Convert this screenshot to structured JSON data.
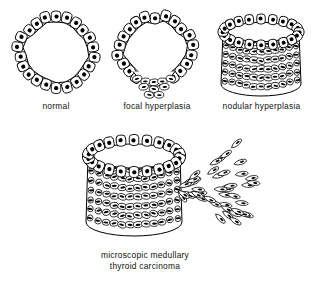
{
  "figure": {
    "background_color": "#ffffff",
    "ink_color": "#000000",
    "caption_color": "#111111"
  },
  "panels": [
    {
      "id": "normal",
      "label": "normal",
      "stage_index": 1,
      "description": "Single layer of follicular cells forming a closed ring around an open lumen",
      "x": 8,
      "y": 6,
      "width": 96,
      "height": 92,
      "caption_x": 8,
      "caption_y": 101,
      "caption_width": 96,
      "geometry": {
        "type": "ring",
        "center_x": 48,
        "center_y": 46,
        "radius_x": 37,
        "radius_y": 35,
        "cell_count": 22,
        "cell_length": 11,
        "cell_width": 9.5,
        "nucleus_radius": 2.1,
        "irregularity": 0.055
      }
    },
    {
      "id": "focal-hyperplasia",
      "label": "focal hyperplasia",
      "stage_index": 2,
      "description": "Ring of normal cells with a localized multilayer proliferation at the lower pole",
      "x": 107,
      "y": 6,
      "width": 100,
      "height": 92,
      "caption_x": 101,
      "caption_y": 101,
      "caption_width": 112,
      "geometry": {
        "type": "ring-with-focus",
        "center_x": 48,
        "center_y": 44,
        "radius_x": 36,
        "radius_y": 34,
        "cell_count": 22,
        "cell_length": 11,
        "cell_width": 9.5,
        "nucleus_radius": 2.1,
        "irregularity": 0.07,
        "focus": {
          "center_x": 47,
          "center_y": 76,
          "half_width": 21,
          "rows": 3,
          "row_height": 7,
          "cell_width": 9,
          "nucleus_length": 4.6,
          "nucleus_height": 1.9
        }
      }
    },
    {
      "id": "nodular-hyperplasia",
      "label": "nodular hyperplasia",
      "stage_index": 3,
      "description": "Drum-shaped nodule: rim of follicular cells above a thick multilayered wall of spindle cells",
      "x": 212,
      "y": 6,
      "width": 98,
      "height": 92,
      "caption_x": 206,
      "caption_y": 101,
      "caption_width": 111,
      "geometry": {
        "type": "drum",
        "center_x": 49,
        "rim_y": 26,
        "rim_radius_x": 38,
        "rim_radius_y": 13,
        "base_y": 78,
        "base_radius_x": 40,
        "base_radius_y": 12,
        "rim_cell_count": 20,
        "rim_cell_length": 10,
        "rim_cell_width": 8.5,
        "nucleus_radius": 2.0,
        "wall_rows": 6,
        "wall_cols": 11,
        "wall_nucleus_length": 4.8,
        "wall_nucleus_height": 2.0
      }
    },
    {
      "id": "microscopic-medullary-thyroid-carcinoma",
      "label": "microscopic medullary\nthyroid carcinoma",
      "label_lines": [
        "microscopic medullary",
        "thyroid carcinoma"
      ],
      "stage_index": 4,
      "description": "Nodule with cells breaching the basement membrane and streaming outward to the right as an invasive front",
      "x": 62,
      "y": 126,
      "width": 185,
      "height": 122,
      "caption_x": 62,
      "caption_y": 250,
      "caption_width": 166,
      "geometry": {
        "type": "drum-with-invasion",
        "center_x": 72,
        "rim_y": 30,
        "rim_radius_x": 46,
        "rim_radius_y": 16,
        "base_y": 96,
        "base_radius_x": 48,
        "base_radius_y": 14,
        "rim_cell_count": 22,
        "rim_cell_length": 11,
        "rim_cell_width": 9.5,
        "nucleus_radius": 2.1,
        "wall_rows": 7,
        "wall_cols": 12,
        "wall_nucleus_length": 5.0,
        "wall_nucleus_height": 2.1,
        "invasion": {
          "origin_x": 112,
          "origin_y": 62,
          "spread_count": 46,
          "reach_x": 74,
          "fan_half_angle_deg": 48,
          "cell_length": 13,
          "cell_width": 5.6,
          "nucleus_length": 4.4,
          "nucleus_height": 1.9
        }
      }
    }
  ]
}
